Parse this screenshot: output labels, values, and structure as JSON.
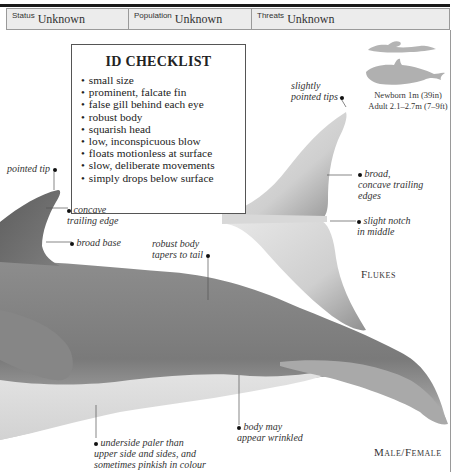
{
  "header": {
    "fields": [
      {
        "label": "Status",
        "value": "Unknown"
      },
      {
        "label": "Population",
        "value": "Unknown"
      },
      {
        "label": "Threats",
        "value": "Unknown"
      }
    ]
  },
  "checklist": {
    "title": "ID CHECKLIST",
    "items": [
      "small size",
      "prominent, falcate fin",
      "false gill behind each eye",
      "robust body",
      "squarish head",
      "low, inconspicuous blow",
      "floats motionless at surface",
      "slow, deliberate movements",
      "simply drops below surface"
    ]
  },
  "size_comparison": {
    "icons": [
      "swimmer-silhouette-icon",
      "dolphin-silhouette-icon"
    ],
    "newborn": "Newborn 1m (39in)",
    "adult": "Adult 2.1–2.7m (7–9ft)"
  },
  "flukes": {
    "title": "Flukes",
    "annotations": {
      "tips": [
        "slightly",
        "pointed tips"
      ],
      "trailing": [
        "broad,",
        "concave trailing",
        "edges"
      ],
      "notch": [
        "slight notch",
        "in middle"
      ]
    }
  },
  "body": {
    "title": "Male/Female",
    "annotations": {
      "fin_tip": "pointed tip",
      "fin_edge": [
        "concave",
        "trailing edge"
      ],
      "fin_base": "broad base",
      "tail": [
        "robust body",
        "tapers to tail"
      ],
      "wrinkled": [
        "body may",
        "appear wrinkled"
      ],
      "underside": [
        "underside paler than",
        "upper side and sides, and",
        "sometimes pinkish in colour"
      ]
    }
  },
  "colors": {
    "body_dark": "#6f6f6f",
    "body_mid": "#8a8a8a",
    "underside": "#d9d9d9",
    "silhouette": "#b0b0b0",
    "header_bg": "#ececec"
  }
}
